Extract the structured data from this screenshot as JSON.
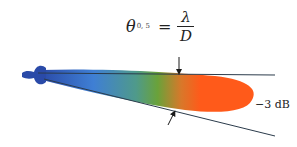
{
  "formula": {
    "lhs_symbol": "θ",
    "lhs_subscript": "0, 5",
    "equals": "=",
    "numerator": "λ",
    "denominator": "D"
  },
  "annotation": {
    "label": "−3 dB"
  },
  "colors": {
    "lobe_base": "#2a4aa8",
    "lobe_mid_blue": "#3f7fd4",
    "lobe_green": "#5a9a3a",
    "lobe_tip": "#ff5a1a",
    "lines": "#2b3b4b"
  }
}
